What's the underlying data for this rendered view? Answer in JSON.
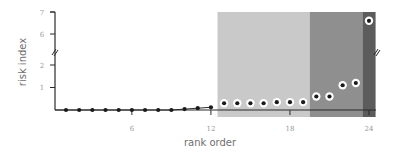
{
  "chart_data": {
    "type": "scatter",
    "title": "",
    "xlabel": "rank order",
    "ylabel": "risk index",
    "x_ticks": [
      6,
      12,
      18,
      24
    ],
    "y_ticks_lower": [
      1,
      2
    ],
    "y_ticks_upper": [
      6,
      7
    ],
    "y_axis_break": {
      "between": [
        2,
        6
      ]
    },
    "xlim": [
      0.2,
      24.5
    ],
    "ylim": [
      0,
      7
    ],
    "grid": false,
    "legend": null,
    "bands": [
      {
        "name": "light",
        "x_start": 12.5,
        "x_end": 19.5,
        "color": "#c9c9c9"
      },
      {
        "name": "medium",
        "x_start": 19.5,
        "x_end": 23.5,
        "color": "#8f8f8f"
      },
      {
        "name": "dark",
        "x_start": 23.5,
        "x_end": 24.5,
        "color": "#5c5c5c"
      }
    ],
    "x": [
      1,
      2,
      3,
      4,
      5,
      6,
      7,
      8,
      9,
      10,
      11,
      12,
      13,
      14,
      15,
      16,
      17,
      18,
      19,
      20,
      21,
      22,
      23,
      24
    ],
    "values": [
      0.0,
      0.0,
      0.0,
      0.0,
      0.0,
      0.0,
      0.0,
      0.0,
      0.0,
      0.04,
      0.08,
      0.12,
      0.3,
      0.3,
      0.3,
      0.3,
      0.35,
      0.35,
      0.35,
      0.6,
      0.6,
      1.1,
      1.2,
      6.6
    ],
    "point_style": {
      "plain_through_rank": 12,
      "ringed_from_rank": 13
    }
  },
  "colors": {
    "axis": "#2a2a2a",
    "dot": "#1a1a1a",
    "ring": "#ffffff",
    "tick_text": "#9a9a9a",
    "title_text": "#6e6e6e"
  }
}
